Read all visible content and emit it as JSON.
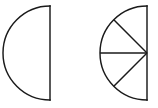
{
  "figure": {
    "background_color": "#ffffff",
    "stroke_color": "#1a1a1a",
    "stroke_width": 1.45,
    "canvas": {
      "width": 158,
      "height": 108
    }
  },
  "shapes": [
    {
      "id": "left-semicircle",
      "name": "undivided-semicircle",
      "label": "Whole semicircle, undivided",
      "center_x": 50,
      "center_y": 53,
      "radius": 47,
      "orientation": "flat-edge-right",
      "diameter_line": {
        "x": 50,
        "y_top": 6,
        "y_bottom": 100
      },
      "sector_count": 1,
      "divider_count": 0,
      "sector_angle_degrees": 180,
      "shaded": false,
      "fill": "none"
    },
    {
      "id": "right-semicircle",
      "name": "divided-semicircle",
      "label": "Semicircle divided into four equal sectors",
      "center_x": 147,
      "center_y": 53,
      "radius": 47,
      "orientation": "flat-edge-right",
      "diameter_line": {
        "x": 147,
        "y_top": 6,
        "y_bottom": 100
      },
      "sector_count": 4,
      "divider_count": 3,
      "sector_angle_degrees": 45,
      "shaded": false,
      "fill": "none",
      "dividers": [
        {
          "id": "divider-upper-diagonal",
          "angle_degrees": 135,
          "end_x": 113.8,
          "end_y": 19.8
        },
        {
          "id": "divider-horizontal",
          "angle_degrees": 180,
          "end_x": 100.0,
          "end_y": 53.0
        },
        {
          "id": "divider-lower-diagonal",
          "angle_degrees": 225,
          "end_x": 113.8,
          "end_y": 86.2
        }
      ]
    }
  ],
  "geometry_paths": {
    "left_arc": "M 50 6 A 47 47 0 0 0 50 100",
    "left_diameter": "M 50 6 L 50 100",
    "right_arc": "M 147 6 A 47 47 0 0 0 147 100",
    "right_diameter": "M 147 6 L 147 100",
    "right_divider_upper": "M 147 53 L 113.8 19.8",
    "right_divider_middle": "M 147 53 L 100 53",
    "right_divider_lower": "M 147 53 L 113.8 86.2"
  }
}
